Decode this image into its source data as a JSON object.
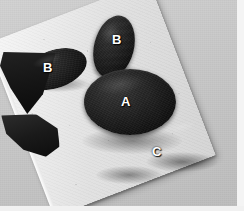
{
  "image": {
    "type": "photograph",
    "subject": "dark specimen fragments arranged on a white foam board",
    "color_mode": "grayscale",
    "width": 244,
    "height": 211
  },
  "palette": {
    "background_gray": "#c8c8c8",
    "board_white": "#ededed",
    "board_shadow": "#d4d4d4",
    "specimen_black": "#141414",
    "label_white": "#ffffff",
    "frame_white": "#f4f4f4"
  },
  "scene": {
    "background_name": "studio-gray-backdrop",
    "board_name": "white-foam-board",
    "frame_right_name": "right-white-margin",
    "frame_bottom_name": "bottom-white-margin"
  },
  "labels": [
    {
      "id": "b-left",
      "text": "B",
      "specimen": "left-pointed-ellipse"
    },
    {
      "id": "b-top",
      "text": "B",
      "specimen": "upper-pointed-ellipse"
    },
    {
      "id": "a",
      "text": "A",
      "specimen": "central-disc"
    },
    {
      "id": "c",
      "text": "C",
      "specimen": "lower-right-crescent-wedge"
    }
  ],
  "specimens": [
    {
      "id": "b-left",
      "label": "B",
      "shape": "pointed ellipse",
      "position": "left"
    },
    {
      "id": "b-top",
      "label": "B",
      "shape": "pointed ellipse",
      "position": "top center"
    },
    {
      "id": "a",
      "label": "A",
      "shape": "large round disc",
      "position": "center"
    },
    {
      "id": "wedge",
      "label": "",
      "shape": "pointed wedge",
      "position": "below center"
    },
    {
      "id": "c",
      "label": "C",
      "shape": "crescent wedge",
      "position": "lower right"
    }
  ]
}
